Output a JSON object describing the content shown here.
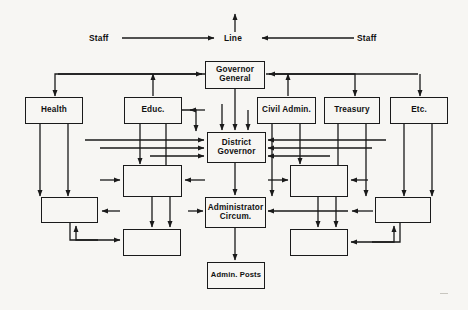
{
  "diagram": {
    "type": "org-chart",
    "canvas": {
      "width": 468,
      "height": 310
    },
    "style": {
      "background": "#f7f6f3",
      "line_color": "#1a1a1a",
      "box_fill": "#f7f6f3",
      "text_color": "#111111"
    },
    "axis_labels": [
      {
        "id": "staff-left",
        "text": "Staff",
        "x": 89,
        "y": 38
      },
      {
        "id": "line-center",
        "text": "Line",
        "x": 224,
        "y": 38
      },
      {
        "id": "staff-right",
        "text": "Staff",
        "x": 357,
        "y": 38
      }
    ],
    "nodes": [
      {
        "id": "governor-general",
        "label": "Governor\nGeneral",
        "x": 205,
        "y": 61,
        "w": 60,
        "h": 28,
        "labeled": true
      },
      {
        "id": "health",
        "label": "Health",
        "x": 25,
        "y": 97,
        "w": 58,
        "h": 27,
        "labeled": true
      },
      {
        "id": "educ",
        "label": "Educ.",
        "x": 124,
        "y": 97,
        "w": 58,
        "h": 27,
        "labeled": true
      },
      {
        "id": "civil-admin",
        "label": "Civil Admin.",
        "x": 257,
        "y": 97,
        "w": 59,
        "h": 27,
        "labeled": true
      },
      {
        "id": "treasury",
        "label": "Treasury",
        "x": 324,
        "y": 97,
        "w": 56,
        "h": 27,
        "labeled": true
      },
      {
        "id": "etc",
        "label": "Etc.",
        "x": 390,
        "y": 97,
        "w": 58,
        "h": 27,
        "labeled": true
      },
      {
        "id": "district-governor",
        "label": "District\nGovernor",
        "x": 207,
        "y": 132,
        "w": 59,
        "h": 31,
        "labeled": true
      },
      {
        "id": "unlabeled-mid-left",
        "label": "",
        "x": 123,
        "y": 165,
        "w": 59,
        "h": 32,
        "labeled": false
      },
      {
        "id": "unlabeled-mid-right",
        "label": "",
        "x": 290,
        "y": 165,
        "w": 58,
        "h": 32,
        "labeled": false
      },
      {
        "id": "administrator-circum",
        "label": "Administrator\nCircum.",
        "x": 205,
        "y": 197,
        "w": 61,
        "h": 31,
        "labeled": true
      },
      {
        "id": "unlabeled-low-left",
        "label": "",
        "x": 41,
        "y": 197,
        "w": 57,
        "h": 26,
        "labeled": false
      },
      {
        "id": "unlabeled-low-right",
        "label": "",
        "x": 375,
        "y": 197,
        "w": 56,
        "h": 26,
        "labeled": false
      },
      {
        "id": "unlabeled-bottom-left",
        "label": "",
        "x": 123,
        "y": 229,
        "w": 58,
        "h": 27,
        "labeled": false
      },
      {
        "id": "unlabeled-bottom-right",
        "label": "",
        "x": 290,
        "y": 229,
        "w": 58,
        "h": 27,
        "labeled": false
      },
      {
        "id": "admin-posts",
        "label": "Admin. Posts",
        "x": 207,
        "y": 262,
        "w": 58,
        "h": 27,
        "labeled": true
      }
    ],
    "hierarchy_levels": [
      "Governor General",
      "Health / Educ. / Civil Admin. / Treasury / Etc.",
      "District Governor",
      "Administrator Circum.",
      "Admin. Posts"
    ]
  }
}
